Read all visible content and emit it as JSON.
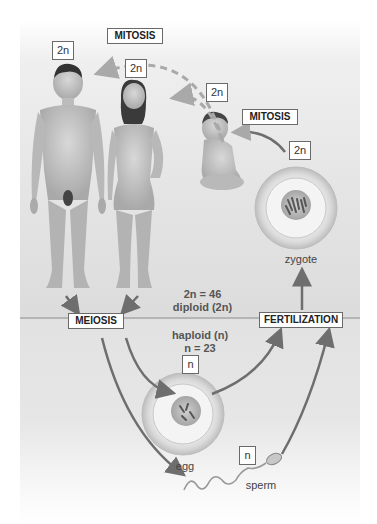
{
  "labels": {
    "mitosis_top": "MITOSIS",
    "mitosis_right": "MITOSIS",
    "meiosis": "MEIOSIS",
    "fertilization": "FERTILIZATION"
  },
  "ploidy": {
    "man": "2n",
    "woman": "2n",
    "baby": "2n",
    "zygote": "2n",
    "egg": "n",
    "sperm": "n"
  },
  "annotations": {
    "diploid_line1": "2n = 46",
    "diploid_line2": "diploid (2n)",
    "haploid_line1": "haploid (n)",
    "haploid_line2": "n = 23"
  },
  "captions": {
    "zygote": "zygote",
    "egg": "egg",
    "sperm": "sperm"
  },
  "colors": {
    "arrow": "#6e6e6e",
    "dashed_arrow": "#a9a9a9",
    "divider": "#8a8a8a"
  }
}
